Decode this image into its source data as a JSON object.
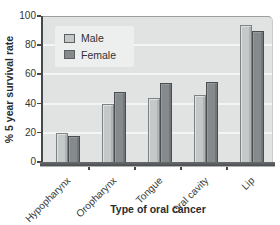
{
  "chart_data": {
    "type": "bar",
    "categories": [
      "Hypopharynx",
      "Oropharynx",
      "Tongue",
      "Oral cavity",
      "Lip"
    ],
    "series": [
      {
        "name": "Male",
        "values": [
          20,
          40,
          44,
          46,
          94
        ],
        "color": "#c4c8c9"
      },
      {
        "name": "Female",
        "values": [
          18,
          48,
          54,
          55,
          90
        ],
        "color": "#858a8c"
      }
    ],
    "title": "",
    "xlabel": "Type of oral cancer",
    "ylabel": "% 5 year survival rate",
    "ylim": [
      0,
      100
    ],
    "yticks": [
      0,
      20,
      40,
      60,
      80,
      100
    ],
    "grid": true,
    "legend_position": "upper-left"
  },
  "colors": {
    "plot_background": "#e0e3e2",
    "legend_background": "#edefee",
    "gridline": "#f3f5f4",
    "axis": "#46494b",
    "text": "#333536"
  }
}
